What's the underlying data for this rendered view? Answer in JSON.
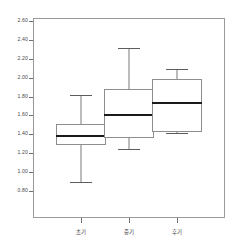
{
  "chart_data": {
    "type": "box",
    "title": "",
    "subtitle": "",
    "xlabel": "",
    "ylabel": "",
    "ylim": [
      0.8,
      2.6
    ],
    "grid": false,
    "legend": null,
    "categories": [
      "초기",
      "중기",
      "후기"
    ],
    "ytick_labels": [
      "2.60",
      "2.40",
      "2.20",
      "2.00",
      "1.80",
      "1.60",
      "1.40",
      "1.20",
      "1.00",
      "0.80"
    ],
    "ytick_values": [
      2.6,
      2.4,
      2.2,
      2.0,
      1.8,
      1.6,
      1.4,
      1.2,
      1.0,
      0.8
    ],
    "boxes": [
      {
        "category": "초기",
        "whisker_low": 0.91,
        "q1": 1.3,
        "median": 1.4,
        "q3": 1.52,
        "whisker_high": 1.83
      },
      {
        "category": "중기",
        "whisker_low": 1.26,
        "q1": 1.37,
        "median": 1.63,
        "q3": 1.89,
        "whisker_high": 2.32
      },
      {
        "category": "후기",
        "whisker_low": 1.42,
        "q1": 1.44,
        "median": 1.75,
        "q3": 2.0,
        "whisker_high": 2.1
      }
    ]
  },
  "colors": {
    "frame": "#9a9a9a",
    "box_border": "#8d8d8d",
    "median": "#1a1a1a",
    "whisker": "#7a7a7a",
    "tick": "#6f6f6f",
    "label": "#4a4a4a",
    "background": "#ffffff"
  }
}
